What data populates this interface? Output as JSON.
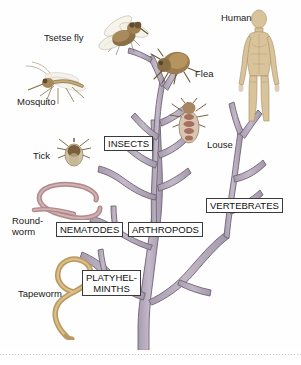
{
  "figure": {
    "background_color": "#fefefe",
    "branch_color": "#b6abbd",
    "branch_outline_color": "#6d6370"
  },
  "clade_labels": [
    {
      "id": "insects",
      "text": "INSECTS",
      "x": 104,
      "y": 136,
      "w": 54,
      "h": 14
    },
    {
      "id": "vertebrates",
      "text": "VERTEBRATES",
      "x": 206,
      "y": 198,
      "w": 80,
      "h": 14
    },
    {
      "id": "nematodes",
      "text": "NEMATODES",
      "x": 56,
      "y": 222,
      "w": 68,
      "h": 14
    },
    {
      "id": "arthropods",
      "text": "ARTHROPODS",
      "x": 128,
      "y": 222,
      "w": 72,
      "h": 14
    },
    {
      "id": "platyhelminths",
      "text": "PLATYHEL-\nMINTHS",
      "x": 82,
      "y": 272,
      "w": 62,
      "h": 26
    }
  ],
  "organism_labels": [
    {
      "id": "tsetse-fly",
      "text": "Tsetse fly",
      "x": 44,
      "y": 32
    },
    {
      "id": "flea",
      "text": "Flea",
      "x": 158,
      "y": 68
    },
    {
      "id": "human",
      "text": "Human",
      "x": 224,
      "y": 12
    },
    {
      "id": "mosquito",
      "text": "Mosquito",
      "x": 18,
      "y": 96
    },
    {
      "id": "louse",
      "text": "Louse",
      "x": 207,
      "y": 139
    },
    {
      "id": "tick",
      "text": "Tick",
      "x": 33,
      "y": 150
    },
    {
      "id": "roundworm",
      "text": "Round-\nworm",
      "x": 12,
      "y": 218
    },
    {
      "id": "tapeworm",
      "text": "Tapeworm",
      "x": 18,
      "y": 288
    }
  ],
  "organisms": [
    {
      "id": "tsetse-fly",
      "name": "tsetse-fly-illustration"
    },
    {
      "id": "mosquito",
      "name": "mosquito-illustration"
    },
    {
      "id": "tick",
      "name": "tick-illustration"
    },
    {
      "id": "flea",
      "name": "flea-illustration"
    },
    {
      "id": "louse",
      "name": "louse-illustration"
    },
    {
      "id": "human",
      "name": "human-figure-illustration"
    },
    {
      "id": "roundworm",
      "name": "roundworm-illustration"
    },
    {
      "id": "tapeworm",
      "name": "tapeworm-illustration"
    }
  ],
  "footer": {
    "rule_style": "dotted",
    "faint_text": ""
  }
}
